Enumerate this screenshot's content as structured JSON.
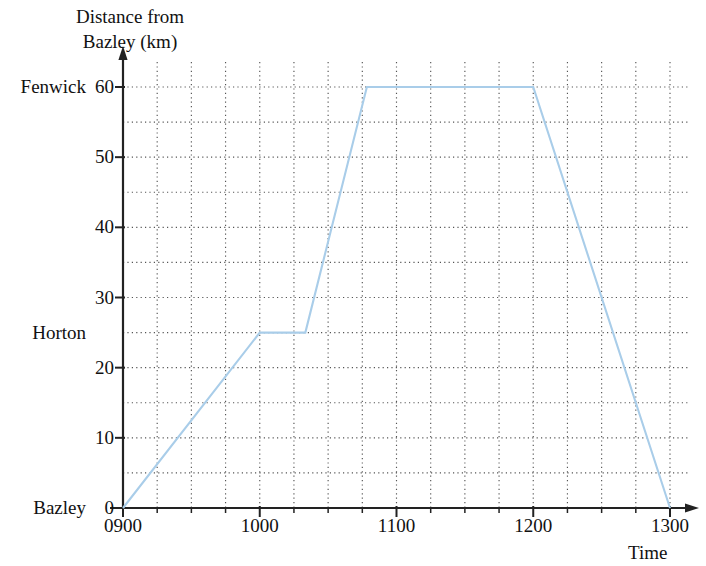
{
  "chart_data": {
    "type": "line",
    "title": "",
    "ylabel_line1": "Distance from",
    "ylabel_line2": "Bazley (km)",
    "xlabel": "Time",
    "x": [
      "0900",
      "1000",
      "1020",
      "1047",
      "1200",
      "1300"
    ],
    "values": [
      0,
      25,
      25,
      60,
      60,
      0
    ],
    "series": [
      {
        "name": "Journey",
        "points": [
          {
            "time": "0900",
            "distance": 0
          },
          {
            "time": "1000",
            "distance": 25
          },
          {
            "time": "1020",
            "distance": 25
          },
          {
            "time": "1047",
            "distance": 60
          },
          {
            "time": "1200",
            "distance": 60
          },
          {
            "time": "1300",
            "distance": 0
          }
        ],
        "color": "#a9cde9"
      }
    ],
    "xlim": [
      "0900",
      "1300"
    ],
    "ylim": [
      0,
      60
    ],
    "x_tick_labels": [
      "0900",
      "1000",
      "1100",
      "1200",
      "1300"
    ],
    "x_major_interval_minutes": 60,
    "x_minor_interval_minutes": 15,
    "y_tick_labels": [
      "0",
      "10",
      "20",
      "30",
      "40",
      "50",
      "60"
    ],
    "y_major_interval": 10,
    "y_minor_interval": 5,
    "grid": true,
    "grid_style": "dotted",
    "grid_color": "#555555",
    "axis_color": "#222222",
    "legend": "none",
    "place_labels": [
      {
        "name": "Fenwick",
        "distance": 60
      },
      {
        "name": "Horton",
        "distance": 25
      },
      {
        "name": "Bazley",
        "distance": 0
      }
    ]
  },
  "axes": {
    "y_title_line1": "Distance from",
    "y_title_line2": "Bazley (km)",
    "x_title": "Time"
  },
  "y_ticks": [
    {
      "label": "60",
      "value": 60
    },
    {
      "label": "50",
      "value": 50
    },
    {
      "label": "40",
      "value": 40
    },
    {
      "label": "30",
      "value": 30
    },
    {
      "label": "20",
      "value": 20
    },
    {
      "label": "10",
      "value": 10
    },
    {
      "label": "0",
      "value": 0
    }
  ],
  "x_ticks": [
    {
      "label": "0900",
      "value": 0
    },
    {
      "label": "1000",
      "value": 60
    },
    {
      "label": "1100",
      "value": 120
    },
    {
      "label": "1200",
      "value": 180
    },
    {
      "label": "1300",
      "value": 240
    }
  ],
  "places": [
    {
      "label": "Fenwick",
      "value": 60
    },
    {
      "label": "Horton",
      "value": 25
    },
    {
      "label": "Bazley",
      "value": 0
    }
  ]
}
